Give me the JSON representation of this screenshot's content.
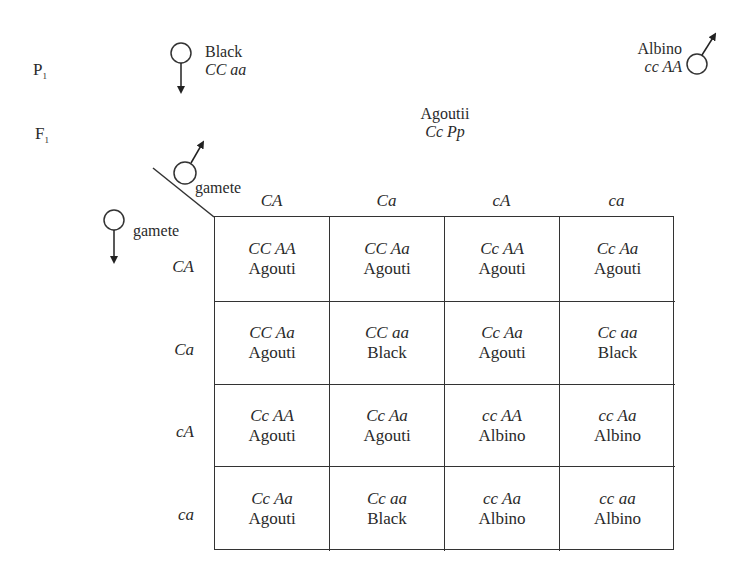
{
  "generations": {
    "p1": {
      "letter": "P",
      "sub": "1"
    },
    "f1": {
      "letter": "F",
      "sub": "1"
    }
  },
  "parents": {
    "female": {
      "symbol": "female-symbol",
      "phenotype": "Black",
      "genotype": "CC aa"
    },
    "male": {
      "symbol": "male-symbol",
      "phenotype": "Albino",
      "genotype": "cc AA"
    }
  },
  "f1": {
    "phenotype": "Agoutii",
    "genotype": "Cc Pp"
  },
  "corner": {
    "male_label": "gamete",
    "female_label": "gamete"
  },
  "column_headers": [
    "CA",
    "Ca",
    "cA",
    "ca"
  ],
  "row_headers": [
    "CA",
    "Ca",
    "cA",
    "ca"
  ],
  "cells": [
    [
      {
        "genotype": "CC AA",
        "phenotype": "Agouti"
      },
      {
        "genotype": "CC Aa",
        "phenotype": "Agouti"
      },
      {
        "genotype": "Cc AA",
        "phenotype": "Agouti"
      },
      {
        "genotype": "Cc Aa",
        "phenotype": "Agouti"
      }
    ],
    [
      {
        "genotype": "CC Aa",
        "phenotype": "Agouti"
      },
      {
        "genotype": "CC aa",
        "phenotype": "Black"
      },
      {
        "genotype": "Cc Aa",
        "phenotype": "Agouti"
      },
      {
        "genotype": "Cc aa",
        "phenotype": "Black"
      }
    ],
    [
      {
        "genotype": "Cc AA",
        "phenotype": "Agouti"
      },
      {
        "genotype": "Cc Aa",
        "phenotype": "Agouti"
      },
      {
        "genotype": "cc AA",
        "phenotype": "Albino"
      },
      {
        "genotype": "cc Aa",
        "phenotype": "Albino"
      }
    ],
    [
      {
        "genotype": "Cc Aa",
        "phenotype": "Agouti"
      },
      {
        "genotype": "Cc aa",
        "phenotype": "Black"
      },
      {
        "genotype": "cc Aa",
        "phenotype": "Albino"
      },
      {
        "genotype": "cc aa",
        "phenotype": "Albino"
      }
    ]
  ]
}
